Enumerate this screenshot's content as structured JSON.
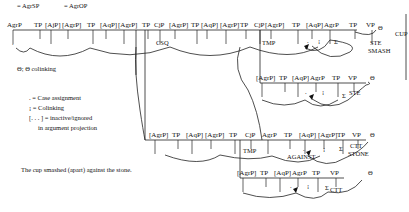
{
  "top_annotations": [
    {
      "text": "= AgrSP",
      "x": 17,
      "y": 8
    },
    {
      "text": "= AgrOP",
      "x": 64,
      "y": 8
    }
  ],
  "legend": {
    "theta": "Θ; Θ colinking",
    "case": ". = Case assignment",
    "colink": "¡ = Colinking",
    "inactive_1": "[. . . ] = inactive/ignored",
    "inactive_2": "in argument projection"
  },
  "sentence": "The cup smashed (apart) against the stone.",
  "rows": [
    {
      "id": "row1",
      "y": 30,
      "x1": 13,
      "x2": 355,
      "labels": [
        "AgrP",
        "TP",
        "[AjP]",
        "[AgrP]",
        "TP",
        "[AqP]",
        "[AgrP]",
        "TP",
        "CjP",
        "[AgrP]",
        "TP",
        "[AqP]",
        "[AgrP]",
        "TP",
        "CjP",
        "[AgrP]",
        "TP",
        "[AqP]",
        "AgrP",
        "TP",
        "VP"
      ],
      "label_x": [
        13,
        40,
        51,
        68,
        93,
        106,
        124,
        148,
        160,
        175,
        197,
        207,
        226,
        246,
        260,
        271,
        298,
        312,
        330,
        355,
        372
      ],
      "sublabels": [
        {
          "text": "CSQ",
          "x": 156,
          "y": 45
        },
        {
          "text": "TMP",
          "x": 262,
          "y": 45
        },
        {
          "text": "STE",
          "x": 370,
          "y": 45
        },
        {
          "text": "SMASH",
          "x": 368,
          "y": 53
        },
        {
          "text": "CUP",
          "x": 395,
          "y": 36
        },
        {
          "text": "Θ",
          "x": 378,
          "y": 30
        }
      ]
    },
    {
      "id": "row2",
      "y": 83,
      "x1": 260,
      "x2": 370,
      "labels": [
        "[AgrP]",
        "TP",
        "[AqP]",
        "AgrP",
        "TP",
        "VP"
      ],
      "label_x": [
        262,
        285,
        298,
        316,
        338,
        354
      ],
      "sublabels": [
        {
          "text": "STE",
          "x": 349,
          "y": 95
        },
        {
          "text": "Θ",
          "x": 370,
          "y": 80
        }
      ]
    },
    {
      "id": "row3",
      "y": 140,
      "x1": 145,
      "x2": 370,
      "labels": [
        "[AgrP]",
        "TP",
        "[AqP]",
        "[AgrP]",
        "TP",
        "CjP",
        "AgrP",
        "TP",
        "[AqP]",
        "[AgrP]",
        "TP",
        "VP"
      ],
      "label_x": [
        155,
        178,
        192,
        211,
        235,
        251,
        268,
        290,
        305,
        324,
        343,
        358
      ],
      "sublabels": [
        {
          "text": "TMP",
          "x": 243,
          "y": 153
        },
        {
          "text": "AGAINST",
          "x": 287,
          "y": 159
        },
        {
          "text": "CTT",
          "x": 350,
          "y": 148
        },
        {
          "text": "STONE",
          "x": 348,
          "y": 156
        },
        {
          "text": "Θ",
          "x": 370,
          "y": 137
        }
      ]
    },
    {
      "id": "row4",
      "y": 178,
      "x1": 240,
      "x2": 365,
      "labels": [
        "[AgrP]",
        "TP",
        "[AqP]",
        "AgrP",
        "TP",
        "VP"
      ],
      "label_x": [
        243,
        266,
        280,
        298,
        318,
        336
      ],
      "sublabels": [
        {
          "text": "CTT",
          "x": 330,
          "y": 192
        },
        {
          "text": "Θ",
          "x": 368,
          "y": 175
        }
      ]
    }
  ]
}
